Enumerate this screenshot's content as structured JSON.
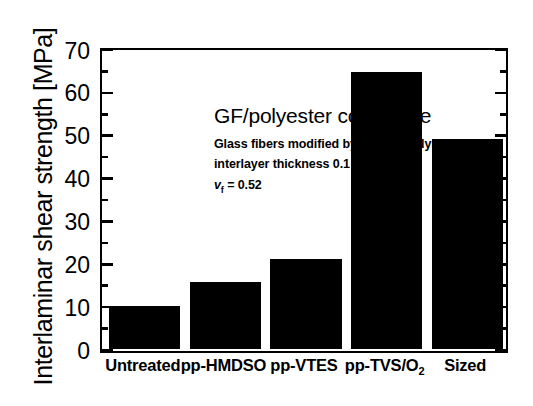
{
  "chart_data": {
    "type": "bar",
    "title": "GF/polyester composite",
    "categories": [
      "Untreated",
      "pp-HMDSO",
      "pp-VTES",
      "pp-TVS/O2",
      "Sized"
    ],
    "category_labels_html": [
      "Untreated",
      "pp-HMDSO",
      "pp-VTES",
      "pp-TVS/O<sub>2</sub>",
      "Sized"
    ],
    "values": [
      10,
      15.5,
      21,
      64.5,
      49
    ],
    "xlabel": "",
    "ylabel": "Interlaminar shear strength [MPa]",
    "ylim": [
      0,
      70
    ],
    "ytick_major_step": 10,
    "ytick_minor_step": 5,
    "ytick_labels": [
      "0",
      "10",
      "20",
      "30",
      "40",
      "50",
      "60",
      "70"
    ],
    "grid": false,
    "legend": false,
    "bar_color": "#000000",
    "background_color": "#ffffff",
    "axis_color": "#000000",
    "annotations": [
      "Glass fibers modified by plasma polymer",
      "interlayer thickness 0.1 µm",
      "v_f = 0.52"
    ]
  },
  "figure": {
    "y_axis_title": "Interlaminar shear strength [MPa]",
    "annotation_title": "GF/polyester composite",
    "annotation_line1": "Glass fibers modified by plasma polymer",
    "annotation_line2": "interlayer thickness 0.1 µm",
    "annotation_line3_symbol": "v",
    "annotation_line3_subscript": "f",
    "annotation_line3_value": " = 0.52"
  }
}
